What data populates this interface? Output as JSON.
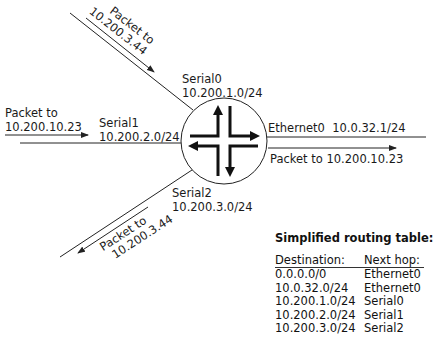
{
  "diagram": {
    "router": {
      "name": "router",
      "center": [
        224,
        141
      ],
      "radius": 43
    },
    "interfaces": {
      "serial0": {
        "name": "Serial0",
        "network": "10.200.1.0/24"
      },
      "serial1": {
        "name": "Serial1",
        "network": "10.200.2.0/24"
      },
      "serial2": {
        "name": "Serial2",
        "network": "10.200.3.0/24"
      },
      "ethernet0": {
        "name": "Ethernet0",
        "address": "10.0.32.1/24"
      }
    },
    "packets": {
      "top_left": {
        "line1": "Packet to",
        "line2": "10.200.3.44",
        "direction": "inbound"
      },
      "left": {
        "line1": "Packet to",
        "line2": "10.200.10.23",
        "direction": "inbound"
      },
      "right": {
        "label": "Packet to 10.200.10.23",
        "direction": "outbound"
      },
      "bottom_left": {
        "line1": "Packet to",
        "line2": "10.200.3.44",
        "direction": "outbound"
      }
    }
  },
  "routing_table": {
    "title": "Simplified routing table:",
    "headers": [
      "Destination:",
      "Next hop:"
    ],
    "rows": [
      [
        "0.0.0.0/0",
        "Ethernet0"
      ],
      [
        "10.0.32.0/24",
        "Ethernet0"
      ],
      [
        "10.200.1.0/24",
        "Serial0"
      ],
      [
        "10.200.2.0/24",
        "Serial1"
      ],
      [
        "10.200.3.0/24",
        "Serial2"
      ]
    ]
  },
  "colors": {
    "line": "#222222",
    "background": "#ffffff"
  }
}
